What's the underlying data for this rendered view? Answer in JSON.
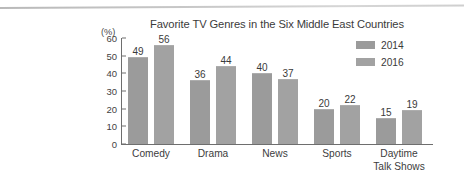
{
  "figure": {
    "unit_label": "(%)",
    "artifact": "scan-line"
  },
  "chart_data": {
    "type": "bar",
    "title": "Favorite TV Genres in the Six Middle East Countries",
    "xlabel": "",
    "ylabel": "(%)",
    "ylim": [
      0,
      60
    ],
    "yticks": [
      0,
      10,
      20,
      30,
      40,
      50,
      60
    ],
    "grid": false,
    "legend_position": "top-right",
    "categories": [
      "Comedy",
      "Drama",
      "News",
      "Sports",
      "Daytime Talk Shows"
    ],
    "category_lines": [
      [
        "Comedy"
      ],
      [
        "Drama"
      ],
      [
        "News"
      ],
      [
        "Sports"
      ],
      [
        "Daytime",
        "Talk Shows"
      ]
    ],
    "series": [
      {
        "name": "2014",
        "color": "#9b9b9b",
        "values": [
          49,
          36,
          40,
          20,
          15
        ]
      },
      {
        "name": "2016",
        "color": "#a2a2a2",
        "values": [
          56,
          44,
          37,
          22,
          19
        ]
      }
    ]
  }
}
